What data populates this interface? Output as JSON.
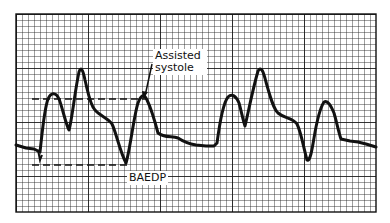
{
  "figure": {
    "type": "arterial pressure tracing on grid paper",
    "colors": {
      "background": "#ffffff",
      "grid_minor": "#333333",
      "grid_major": "#111111",
      "trace": "#111111"
    }
  },
  "annotations": {
    "assisted_systole_line1": "Assisted",
    "assisted_systole_line2": "systole",
    "baedp": "BAEDP"
  }
}
